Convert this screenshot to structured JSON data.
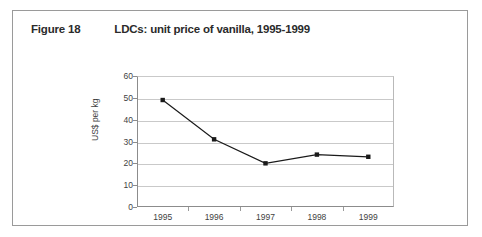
{
  "figure": {
    "number": "Figure 18",
    "title": "LDCs: unit price of vanilla, 1995-1999"
  },
  "chart_data": {
    "type": "line",
    "title": "LDCs: unit price of vanilla, 1995-1999",
    "xlabel": "",
    "ylabel": "US$ per kg",
    "categories": [
      "1995",
      "1996",
      "1997",
      "1998",
      "1999"
    ],
    "values": [
      49,
      31,
      20,
      24,
      23
    ],
    "ylim": [
      0,
      60
    ],
    "ytick_labels": [
      "0",
      "10",
      "20",
      "30",
      "40",
      "50",
      "60"
    ],
    "ytick_values": [
      0,
      10,
      20,
      30,
      40,
      50,
      60
    ],
    "grid": "horizontal",
    "legend": "none",
    "series_color": "#1a1a1a",
    "marker": "diamond",
    "gridline_color": "#c9c9c9",
    "axis_color": "#8c8c8c"
  }
}
